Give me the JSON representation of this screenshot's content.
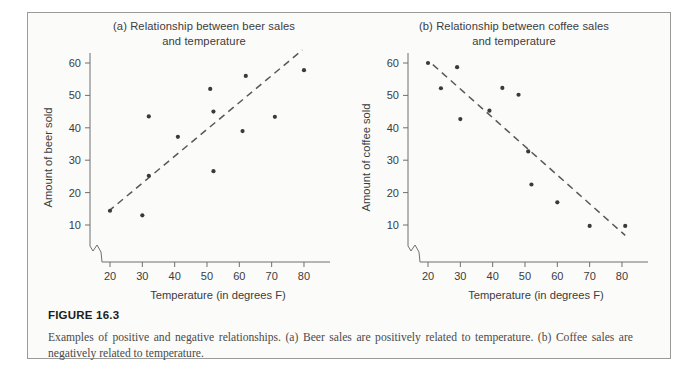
{
  "figure": {
    "number_label": "FIGURE 16.3",
    "caption": "Examples of positive and negative relationships. (a) Beer sales are positively related to temperature. (b) Coffee sales are negatively related to temperature."
  },
  "colors": {
    "frame_border": "#9a9a98",
    "panel_background": "#fbfbfa",
    "axis": "#6f6f6f",
    "point": "#3a3a3a",
    "trend_line": "#585858",
    "text": "#3c3c3c",
    "caption_text": "#4a4a4a"
  },
  "panels": [
    {
      "id": "a",
      "title": "(a) Relationship between beer sales and temperature",
      "title_line_1": "(a) Relationship between beer sales",
      "title_line_2": "and temperature"
    },
    {
      "id": "b",
      "title": "(b) Relationship between coffee sales and temperature",
      "title_line_1": "(b) Relationship between coffee sales",
      "title_line_2": "and temperature"
    }
  ],
  "chart_data": [
    {
      "type": "scatter",
      "panel": "a",
      "title": "(a) Relationship between beer sales and temperature",
      "xlabel": "Temperature (in degrees F)",
      "ylabel": "Amount of beer sold",
      "xlim": [
        15,
        87
      ],
      "ylim": [
        4,
        64
      ],
      "xticks": [
        20,
        30,
        40,
        50,
        60,
        70,
        80
      ],
      "xtick_labels": [
        "20",
        "30",
        "40",
        "50",
        "60",
        "70",
        "80"
      ],
      "yticks": [
        10,
        20,
        30,
        40,
        50,
        60
      ],
      "ytick_labels": [
        "10",
        "20",
        "30",
        "40",
        "50",
        "60"
      ],
      "axis_break": true,
      "grid": false,
      "legend": "none",
      "x": [
        20,
        30,
        32,
        32,
        41,
        51,
        52,
        52,
        61,
        62,
        71,
        80
      ],
      "y": [
        14.4,
        13,
        43.5,
        25.2,
        37.2,
        52,
        45,
        26.6,
        39,
        56,
        43.4,
        57.8
      ],
      "points": [
        {
          "x": 20,
          "y": 14.4
        },
        {
          "x": 30,
          "y": 13.0
        },
        {
          "x": 32,
          "y": 43.5
        },
        {
          "x": 32,
          "y": 25.2
        },
        {
          "x": 41,
          "y": 37.2
        },
        {
          "x": 51,
          "y": 52.0
        },
        {
          "x": 52,
          "y": 45.0
        },
        {
          "x": 52,
          "y": 26.6
        },
        {
          "x": 61,
          "y": 39.0
        },
        {
          "x": 62,
          "y": 56.0
        },
        {
          "x": 71,
          "y": 43.4
        },
        {
          "x": 80,
          "y": 57.8
        }
      ],
      "trend": {
        "x0": 19.5,
        "y0": 14.2,
        "x1": 79.5,
        "y1": 64.0,
        "style": "dashed",
        "direction": "positive"
      }
    },
    {
      "type": "scatter",
      "panel": "b",
      "title": "(b) Relationship between coffee sales and temperature",
      "xlabel": "Temperature (in degrees F)",
      "ylabel": "Amount of coffee sold",
      "xlim": [
        15,
        87
      ],
      "ylim": [
        4,
        64
      ],
      "xticks": [
        20,
        30,
        40,
        50,
        60,
        70,
        80
      ],
      "xtick_labels": [
        "20",
        "30",
        "40",
        "50",
        "60",
        "70",
        "80"
      ],
      "yticks": [
        10,
        20,
        30,
        40,
        50,
        60
      ],
      "ytick_labels": [
        "10",
        "20",
        "30",
        "40",
        "50",
        "60"
      ],
      "axis_break": true,
      "grid": false,
      "legend": "none",
      "x": [
        20,
        24,
        29,
        30,
        39,
        43,
        48,
        51,
        52,
        53,
        60,
        70,
        81
      ],
      "y": [
        60.0,
        52.2,
        58.7,
        42.7,
        45.3,
        52.3,
        50.2,
        32.7,
        22.5,
        50.2,
        17.0,
        9.7,
        9.7
      ],
      "points": [
        {
          "x": 20,
          "y": 60.0
        },
        {
          "x": 24,
          "y": 52.2
        },
        {
          "x": 29,
          "y": 58.7
        },
        {
          "x": 30,
          "y": 42.7
        },
        {
          "x": 39,
          "y": 45.3
        },
        {
          "x": 43,
          "y": 52.3
        },
        {
          "x": 48,
          "y": 50.2
        },
        {
          "x": 51,
          "y": 32.7
        },
        {
          "x": 52,
          "y": 22.5
        },
        {
          "x": 60,
          "y": 17.0
        },
        {
          "x": 70,
          "y": 9.7
        },
        {
          "x": 81,
          "y": 9.7
        }
      ],
      "trend": {
        "x0": 21.5,
        "y0": 59.5,
        "x1": 81.0,
        "y1": 6.8,
        "style": "dashed",
        "direction": "negative"
      }
    }
  ]
}
